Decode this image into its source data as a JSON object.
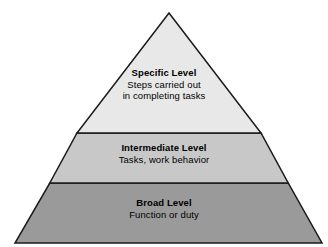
{
  "diagram": {
    "type": "pyramid",
    "background_color": "#ffffff",
    "outline_color": "#1a1a1a",
    "apex": {
      "x": 169,
      "y": 13
    },
    "base_left": {
      "x": 15,
      "y": 243
    },
    "base_right": {
      "x": 322,
      "y": 243
    },
    "divider_y": [
      133,
      183
    ],
    "tiers": [
      {
        "id": "specific",
        "position": "top",
        "title": "Specific Level",
        "description_lines": [
          "Steps carried out",
          "in completing tasks"
        ],
        "fill_color": "#e8e8e8"
      },
      {
        "id": "intermediate",
        "position": "middle",
        "title": "Intermediate Level",
        "description_lines": [
          "Tasks, work behavior"
        ],
        "fill_color": "#c8c8c8"
      },
      {
        "id": "broad",
        "position": "bottom",
        "title": "Broad Level",
        "description_lines": [
          "Function or duty"
        ],
        "fill_color": "#9a9a9a"
      }
    ]
  }
}
